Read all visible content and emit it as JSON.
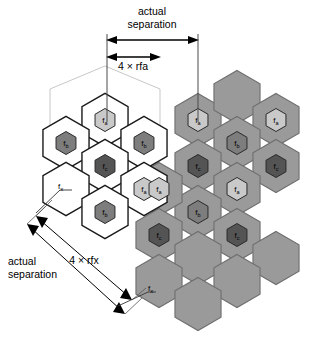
{
  "figure": {
    "background": "#ffffff"
  },
  "colors": {
    "white_cell_fill": "#ffffff",
    "gray_cell_fill": "#9a9a9a",
    "cell_stroke_dark": "#1a1a1a",
    "cell_stroke_gray": "#6e6e6e",
    "fa_fill": "#c9c9c9",
    "fb_fill": "#7d7d7d",
    "fc_fill": "#545454",
    "cluster_outline": "#b0b0b0",
    "dimension_line": "#000000",
    "leader_line": "#333333"
  },
  "annotations": {
    "top_upper_label_line1": "actual",
    "top_upper_label_line2": "separation",
    "top_lower_label": "4 × rfa",
    "left_lower_label_line1": "actual",
    "left_lower_label_line2": "separation",
    "left_diag_label": "4 × rfx",
    "fx_label_left": "fx",
    "fx_label_bottom": "fx"
  },
  "frequency_labels": {
    "fa": {
      "base": "f",
      "sub": "a"
    },
    "fb": {
      "base": "f",
      "sub": "b"
    },
    "fc": {
      "base": "f",
      "sub": "c"
    },
    "fx": {
      "base": "f",
      "sub": "x"
    }
  },
  "chart_data": {
    "type": "diagram",
    "clusters": [
      {
        "name": "reference-cluster",
        "style": "white",
        "cells": [
          {
            "cx": 105,
            "cy": 120,
            "freq": "fa"
          },
          {
            "cx": 66,
            "cy": 143,
            "freq": "fb"
          },
          {
            "cx": 144,
            "cy": 143,
            "freq": "fb"
          },
          {
            "cx": 105,
            "cy": 166,
            "freq": "fc"
          },
          {
            "cx": 66,
            "cy": 189,
            "freq": null
          },
          {
            "cx": 144,
            "cy": 189,
            "freq": "fa"
          },
          {
            "cx": 105,
            "cy": 212,
            "freq": "fb"
          }
        ]
      },
      {
        "name": "co-channel-cluster",
        "style": "gray",
        "cells": [
          {
            "cx": 198,
            "cy": 120,
            "freq": "fa"
          },
          {
            "cx": 237,
            "cy": 97,
            "freq": null
          },
          {
            "cx": 276,
            "cy": 120,
            "freq": "fa"
          },
          {
            "cx": 237,
            "cy": 143,
            "freq": "fb"
          },
          {
            "cx": 198,
            "cy": 166,
            "freq": "fc"
          },
          {
            "cx": 276,
            "cy": 166,
            "freq": "fc"
          },
          {
            "cx": 237,
            "cy": 189,
            "freq": "fa"
          },
          {
            "cx": 198,
            "cy": 212,
            "freq": "fb"
          },
          {
            "cx": 159,
            "cy": 189,
            "freq": "fa"
          },
          {
            "cx": 159,
            "cy": 235,
            "freq": "fc"
          },
          {
            "cx": 237,
            "cy": 235,
            "freq": "fc"
          },
          {
            "cx": 198,
            "cy": 258,
            "freq": null
          },
          {
            "cx": 276,
            "cy": 258,
            "freq": null
          },
          {
            "cx": 159,
            "cy": 281,
            "freq": null
          },
          {
            "cx": 237,
            "cy": 281,
            "freq": null
          },
          {
            "cx": 198,
            "cy": 304,
            "freq": null
          }
        ]
      }
    ],
    "dimensions": [
      {
        "name": "actual-separation-horizontal",
        "from_x": 107,
        "to_x": 198,
        "y": 40,
        "label": "actual separation"
      },
      {
        "name": "four-rfa",
        "from_x": 107,
        "to_x": 160,
        "y": 57,
        "label": "4 × rfa"
      },
      {
        "name": "four-rfx-diagonal",
        "from": [
          38,
          218
        ],
        "to": [
          130,
          298
        ],
        "label": "4 × rfx"
      },
      {
        "name": "actual-separation-diagonal",
        "from": [
          29,
          226
        ],
        "to": [
          123,
          312
        ],
        "label": "actual separation"
      }
    ]
  }
}
